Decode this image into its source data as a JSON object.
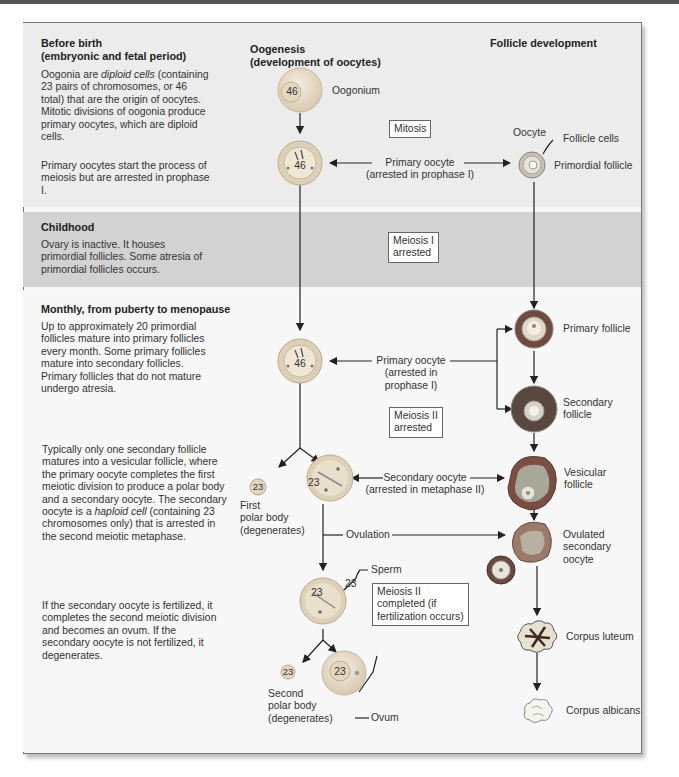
{
  "columns": {
    "oogenesis_title_1": "Oogenesis",
    "oogenesis_title_2": "(development of oocytes)",
    "follicle_title": "Follicle development"
  },
  "stages": [
    {
      "heading_1": "Before birth",
      "heading_2": "(embryonic and fetal period)",
      "para1_a": "Oogonia are ",
      "para1_italic": "diploid cells",
      "para1_b": " (containing 23 pairs of chromosomes, or 46 total) that are the origin of oocytes. Mitotic divisions of oogonia produce primary oocytes, which are diploid cells.",
      "para2": "Primary oocytes start the process of meiosis but are arrested in prophase I."
    },
    {
      "heading_1": "Childhood",
      "para1": "Ovary is inactive. It houses primordial follicles. Some atresia of primordial follicles occurs."
    },
    {
      "heading_1": "Monthly, from puberty to menopause",
      "para1": "Up to approximately 20 primordial follicles mature into primary follicles every month. Some primary follicles mature into secondary follicles. Primary follicles that do not mature undergo atresia.",
      "para2_a": "Typically only one secondary follicle matures into a vesicular follicle, where the primary oocyte completes the first meiotic division to produce a polar body and a secondary oocyte. The secondary oocyte is a ",
      "para2_italic": "haploid cell",
      "para2_b": " (containing 23 chromosomes only) that is arrested in the second meiotic metaphase.",
      "para3": "If the secondary oocyte is fertilized, it completes the second meiotic division and becomes an ovum. If the secondary oocyte is not fertilized, it degenerates."
    }
  ],
  "cells": {
    "oogonium_count": "46",
    "oogonium_label": "Oogonium",
    "primary_oocyte_count": "46",
    "primary_oocyte_count_2": "46",
    "secondary_oocyte_count": "23",
    "first_polar_count": "23",
    "fertilized_count": "23",
    "sperm_count": "23",
    "second_polar_count": "23",
    "ovum_count": "23"
  },
  "labels": {
    "mitosis": "Mitosis",
    "primary_oocyte_1": "Primary oocyte",
    "primary_oocyte_1_sub": "(arrested in prophase I)",
    "meiosis_i_arrested_1": "Meiosis I",
    "meiosis_i_arrested_2": "arrested",
    "primary_oocyte_2": "Primary oocyte",
    "primary_oocyte_2_sub1": "(arrested in",
    "primary_oocyte_2_sub2": "prophase I)",
    "meiosis_ii_arrested_1": "Meiosis II",
    "meiosis_ii_arrested_2": "arrested",
    "secondary_oocyte": "Secondary oocyte",
    "secondary_oocyte_sub": "(arrested in metaphase II)",
    "first_polar_1": "First",
    "first_polar_2": "polar body",
    "first_polar_3": "(degenerates)",
    "ovulation": "Ovulation",
    "sperm": "Sperm",
    "meiosis_ii_completed_1": "Meiosis II",
    "meiosis_ii_completed_2": "completed (if",
    "meiosis_ii_completed_3": "fertilization occurs)",
    "second_polar_1": "Second",
    "second_polar_2": "polar body",
    "second_polar_3": "(degenerates)",
    "ovum": "Ovum"
  },
  "follicles": {
    "oocyte": "Oocyte",
    "follicle_cells": "Follicle cells",
    "primordial": "Primordial follicle",
    "primary": "Primary follicle",
    "secondary_1": "Secondary",
    "secondary_2": "follicle",
    "vesicular_1": "Vesicular",
    "vesicular_2": "follicle",
    "ovulated_1": "Ovulated",
    "ovulated_2": "secondary",
    "ovulated_3": "oocyte",
    "corpus_luteum": "Corpus luteum",
    "corpus_albicans": "Corpus albicans"
  },
  "colors": {
    "band_before": "#ececec",
    "band_childhood": "#d2d2d2",
    "band_monthly": "#f7f7f7",
    "cell_fill": "#e8dcc8",
    "follicle_dark": "#7a4a3a",
    "arrow": "#222222"
  }
}
